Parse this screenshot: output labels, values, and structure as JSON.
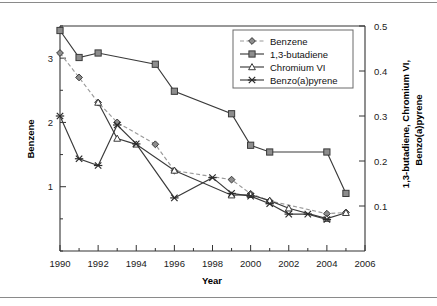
{
  "chart_data": {
    "type": "line",
    "title": "",
    "xlabel": "Year",
    "ylabel": "Benzene",
    "y2label_line1": "1,3-butadiene, Chromium VI,",
    "y2label_line2": "Benzo(a)pyrene",
    "grid": false,
    "legend_position": "top-right",
    "xlim": [
      1990,
      2006
    ],
    "xticks": [
      1990,
      1992,
      1994,
      1996,
      1998,
      2000,
      2002,
      2004,
      2006
    ],
    "xtick_labels": [
      "1990",
      "1992",
      "1994",
      "1996",
      "1998",
      "2000",
      "2002",
      "2004",
      "2006"
    ],
    "xminor_step": 1,
    "ylim": [
      0,
      3.5
    ],
    "yticks": [
      1,
      2,
      3
    ],
    "ytick_labels": [
      "1",
      "2",
      "3"
    ],
    "yminor_step": 0.5,
    "y2lim": [
      0,
      0.5
    ],
    "y2ticks": [
      0.1,
      0.2,
      0.3,
      0.4,
      0.5
    ],
    "y2tick_labels": [
      "0.1",
      "0.2",
      "0.3",
      "0.4",
      "0.5"
    ],
    "series": [
      {
        "name": "Benzene",
        "axis": "left",
        "marker": "diamond",
        "linestyle": "dashed",
        "color": "#8d8d8d",
        "x": [
          1990,
          1991,
          1992,
          1993,
          1995,
          1996,
          1999,
          2000,
          2001,
          2004,
          2005
        ],
        "values": [
          3.08,
          2.7,
          2.31,
          2.0,
          1.66,
          1.25,
          1.11,
          0.89,
          0.78,
          0.58,
          0.6
        ]
      },
      {
        "name": "1,3-butadiene",
        "axis": "right",
        "marker": "square",
        "linestyle": "solid",
        "color": "#8d8d8d",
        "x": [
          1990,
          1991,
          1992,
          1995,
          1996,
          1999,
          2000,
          2001,
          2004,
          2005
        ],
        "values": [
          0.49,
          0.43,
          0.44,
          0.415,
          0.355,
          0.305,
          0.235,
          0.22,
          0.22,
          0.128
        ]
      },
      {
        "name": "Chromium VI",
        "axis": "right",
        "marker": "triangle",
        "linestyle": "solid",
        "color": "#ffffff",
        "x": [
          1992,
          1993,
          1994,
          1996,
          1999,
          2000,
          2001,
          2002,
          2004,
          2005
        ],
        "values": [
          0.33,
          0.25,
          0.237,
          0.179,
          0.124,
          0.125,
          0.112,
          0.095,
          0.072,
          0.085
        ]
      },
      {
        "name": "Benzo(a)pyrene",
        "axis": "right",
        "marker": "x",
        "linestyle": "solid",
        "color": "#2b2b2b",
        "x": [
          1990,
          1991,
          1992,
          1993,
          1994,
          1996,
          1998,
          1999,
          2000,
          2001,
          2002,
          2003,
          2004
        ],
        "values": [
          0.3,
          0.205,
          0.19,
          0.28,
          0.238,
          0.118,
          0.163,
          0.128,
          0.122,
          0.105,
          0.082,
          0.082,
          0.07
        ]
      }
    ]
  },
  "legend": {
    "entries": [
      {
        "label": "Benzene"
      },
      {
        "label": "1,3-butadiene"
      },
      {
        "label": "Chromium VI"
      },
      {
        "label": "Benzo(a)pyrene"
      }
    ]
  }
}
